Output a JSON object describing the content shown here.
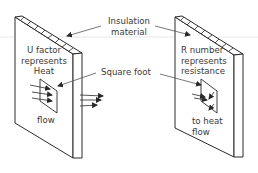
{
  "diagram": {
    "callouts": {
      "insulation": [
        "Insulation",
        "material"
      ],
      "square_foot": "Square foot"
    },
    "left_panel": {
      "label_lines": [
        "U factor",
        "represents",
        "Heat"
      ],
      "bottom_label": "flow"
    },
    "right_panel": {
      "label_lines": [
        "R number",
        "represents",
        "resistance"
      ],
      "bottom_label_lines": [
        "to heat",
        "flow"
      ]
    },
    "colors": {
      "line": "#2a2a2a",
      "text": "#3a3a3a",
      "hatch_fill": "#ffffff",
      "guide_line": "#d8d8d8"
    }
  }
}
